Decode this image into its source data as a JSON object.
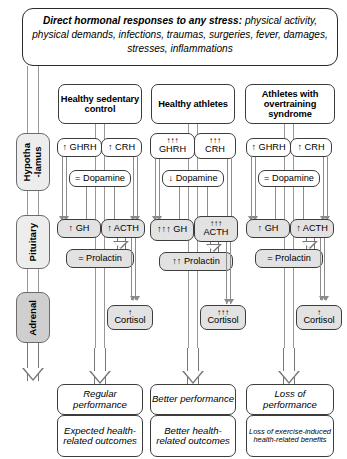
{
  "banner": {
    "lead": "Direct hormonal responses to any stress:",
    "rest": " physical activity, physical demands, infections, traumas, surgeries, fever, damages, stresses, inflammations"
  },
  "axis": {
    "items": [
      {
        "label": "Hypotha\n-lamus",
        "name": "hypothalamus"
      },
      {
        "label": "Pituitary",
        "name": "pituitary"
      },
      {
        "label": "Adrenal",
        "name": "adrenal"
      }
    ]
  },
  "columns": [
    {
      "header": "Healthy sedentary control",
      "ghrh": "↑ GHRH",
      "crh": "↑ CRH",
      "dopamine": "= Dopamine",
      "gh": "↑ GH",
      "acth": "↑ ACTH",
      "prolactin": "= Prolactin",
      "cortisol_arrows": "↑",
      "cortisol": "Cortisol",
      "outcome1": "Regular performance",
      "outcome2": "Expected health-related outcomes"
    },
    {
      "header": "Healthy athletes",
      "ghrh_arrows": "↑↑↑",
      "ghrh": "GHRH",
      "crh_arrows": "↑↑↑",
      "crh": "CRH",
      "dopamine": "↓ Dopamine",
      "gh": "↑↑↑ GH",
      "acth_arrows": "↑↑↑",
      "acth": "ACTH",
      "prolactin": "↑↑ Prolactin",
      "cortisol_arrows": "↑↑↑",
      "cortisol": "Cortisol",
      "outcome1": "Better performance",
      "outcome2": "Better health-related outcomes"
    },
    {
      "header": "Athletes with overtraining syndrome",
      "ghrh": "↑ GHRH",
      "crh": "↑ CRH",
      "dopamine": "= Dopamine",
      "gh": "↑ GH",
      "acth": "↑ ACTH",
      "prolactin": "= Prolactin",
      "cortisol_arrows": "↑",
      "cortisol": "Cortisol",
      "outcome1": "Loss of performance",
      "outcome2": "Loss of exercise-induced health-related benefits"
    }
  ],
  "colors": {
    "box_border": "#3c3c3c",
    "shade": "#e2e2e2",
    "gland_fill": "#ededed",
    "gland_fill_dark": "#cfcfcf",
    "connector": "#8c8c8c"
  }
}
